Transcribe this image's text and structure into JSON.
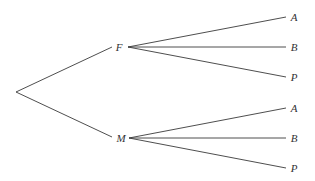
{
  "diagram": {
    "type": "tree",
    "root": {
      "label": "",
      "x": 16,
      "y": 92
    },
    "nodes": [
      {
        "id": "F",
        "label": "F",
        "x": 119,
        "y": 47,
        "anchor_in": {
          "x": 112,
          "y": 47
        },
        "anchor_out": {
          "x": 128,
          "y": 47
        },
        "children": [
          {
            "label": "A",
            "x": 294,
            "y": 17,
            "end": {
              "x": 286,
              "y": 17
            }
          },
          {
            "label": "B",
            "x": 294,
            "y": 47,
            "end": {
              "x": 286,
              "y": 47
            }
          },
          {
            "label": "P",
            "x": 294,
            "y": 77,
            "end": {
              "x": 286,
              "y": 77
            }
          }
        ]
      },
      {
        "id": "M",
        "label": "M",
        "x": 121,
        "y": 138,
        "anchor_in": {
          "x": 112,
          "y": 137
        },
        "anchor_out": {
          "x": 129,
          "y": 138
        },
        "children": [
          {
            "label": "A",
            "x": 294,
            "y": 108,
            "end": {
              "x": 286,
              "y": 108
            }
          },
          {
            "label": "B",
            "x": 294,
            "y": 138,
            "end": {
              "x": 286,
              "y": 138
            }
          },
          {
            "label": "P",
            "x": 294,
            "y": 168,
            "end": {
              "x": 286,
              "y": 168
            }
          }
        ]
      }
    ]
  },
  "colors": {
    "line": "#3a3a3a",
    "text": "#333333",
    "background": "#ffffff"
  }
}
